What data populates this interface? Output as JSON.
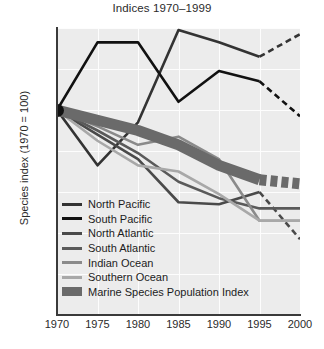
{
  "chart_data": {
    "type": "line",
    "title": "Indices 1970–1999",
    "xlabel": "",
    "ylabel": "Species index (1970 = 100)",
    "xlim": [
      1970,
      2000
    ],
    "ylim": [
      0,
      140
    ],
    "xticks": [
      "1970",
      "1975",
      "1980",
      "1985",
      "1990",
      "1995",
      "2000"
    ],
    "yticks": [
      "0",
      "20",
      "40",
      "60",
      "80",
      "100",
      "120",
      "140"
    ],
    "grid": true,
    "legend_position": "lower-left-inside",
    "x": [
      1970,
      1975,
      1980,
      1985,
      1990,
      1995,
      2000
    ],
    "series": [
      {
        "name": "North Pacific",
        "color": "#333333",
        "values": [
          100,
          73,
          94,
          139,
          133,
          126,
          137
        ],
        "dashed_from": 1995
      },
      {
        "name": "South Pacific",
        "color": "#111111",
        "values": [
          100,
          133,
          133,
          104,
          119,
          114,
          97
        ],
        "dashed_from": 1995
      },
      {
        "name": "North Atlantic",
        "color": "#4a4a4a",
        "values": [
          100,
          88,
          76,
          55,
          54,
          60,
          37
        ],
        "dashed_from": 1995
      },
      {
        "name": "South Atlantic",
        "color": "#5a5a5a",
        "values": [
          100,
          90,
          79,
          65,
          57,
          52,
          52
        ],
        "dashed_from": null
      },
      {
        "name": "Indian Ocean",
        "color": "#8a8a8a",
        "values": [
          100,
          92,
          83,
          87,
          76,
          46,
          46
        ],
        "dashed_from": null
      },
      {
        "name": "Southern Ocean",
        "color": "#a8a8a8",
        "values": [
          100,
          85,
          73,
          70,
          59,
          46,
          46
        ],
        "dashed_from": null
      },
      {
        "name": "Marine Species Population Index",
        "color": "#6a6a6a",
        "values": [
          100,
          95,
          90,
          83,
          73,
          66,
          64
        ],
        "band": true,
        "dashed_from": 1995
      }
    ]
  },
  "legend": {
    "items": [
      {
        "label": "North Pacific",
        "color": "#333333",
        "thick": false
      },
      {
        "label": "South Pacific",
        "color": "#111111",
        "thick": false
      },
      {
        "label": "North Atlantic",
        "color": "#4a4a4a",
        "thick": false
      },
      {
        "label": "South Atlantic",
        "color": "#5a5a5a",
        "thick": false
      },
      {
        "label": "Indian Ocean",
        "color": "#8a8a8a",
        "thick": false
      },
      {
        "label": "Southern Ocean",
        "color": "#a8a8a8",
        "thick": false
      },
      {
        "label": "Marine Species Population Index",
        "color": "#6a6a6a",
        "thick": true
      }
    ]
  },
  "colors": {
    "plot_background": "#ececec",
    "grid": "#fdfdfd",
    "axis": "#3a3a3a",
    "text": "#2b2b2b",
    "origin_marker": "#111111"
  }
}
